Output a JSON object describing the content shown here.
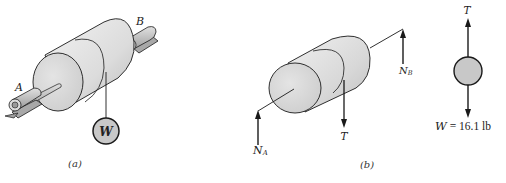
{
  "figure_a": {
    "caption": "(a)",
    "support_a_label": "A",
    "support_b_label": "B",
    "weight_label": "W"
  },
  "figure_b": {
    "caption": "(b)",
    "reaction_a_label": "N",
    "reaction_a_sub": "A",
    "reaction_b_label": "N",
    "reaction_b_sub": "B",
    "tension_label": "T"
  },
  "figure_weight_fbd": {
    "tension_label": "T",
    "weight_equation_symbol": "W",
    "weight_equation_value": "= 16.1 lb"
  },
  "colors": {
    "cylinder_light": "#e6e6e6",
    "cylinder_mid": "#cfcfcf",
    "shaft": "#bdbdbd",
    "weight_fill": "#c8c8c8",
    "stroke": "#1a1a1a"
  }
}
